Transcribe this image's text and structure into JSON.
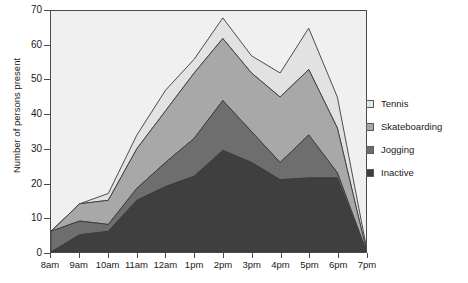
{
  "chart_data": {
    "type": "area",
    "stacked": true,
    "title": "",
    "subtitle": "",
    "xlabel": "",
    "ylabel": "Number of persons present",
    "categories": [
      "8am",
      "9am",
      "10am",
      "11am",
      "12am",
      "1pm",
      "2pm",
      "3pm",
      "4pm",
      "5pm",
      "6pm",
      "7pm"
    ],
    "x_tick_labels": [
      "8am",
      "9am",
      "10am",
      "11am",
      "12am",
      "1pm",
      "2pm",
      "3pm",
      "4pm",
      "5pm",
      "6pm",
      "7pm"
    ],
    "y_tick_labels": [
      "0",
      "10",
      "20",
      "30",
      "40",
      "50",
      "60",
      "70"
    ],
    "y_ticks": [
      0,
      10,
      20,
      30,
      40,
      50,
      60,
      70
    ],
    "ylim": [
      0,
      70
    ],
    "xlim_index": [
      0,
      11
    ],
    "grid": false,
    "legend_position": "right",
    "plot_background": "#f0f0f0",
    "axis_color": "#4a4a4a",
    "series": [
      {
        "name": "Inactive",
        "color": "#3f3f3f",
        "order": 1,
        "values": [
          0,
          5,
          6,
          15,
          19,
          22,
          29.5,
          26,
          21,
          21.5,
          21.5,
          0
        ]
      },
      {
        "name": "Jogging",
        "color": "#6e6e6e",
        "order": 2,
        "values": [
          6,
          4,
          2,
          3.5,
          7,
          11,
          14.5,
          9,
          5,
          12.5,
          1.5,
          0.5
        ]
      },
      {
        "name": "Skateboarding",
        "color": "#a8a8a8",
        "order": 3,
        "values": [
          0,
          5,
          7,
          11.5,
          15,
          19,
          18,
          17,
          19,
          19,
          13,
          0.5
        ]
      },
      {
        "name": "Tennis",
        "color": "#e2e2e2",
        "order": 4,
        "values": [
          0,
          0,
          2,
          4,
          6,
          4,
          6,
          5,
          7,
          12,
          9,
          1
        ]
      }
    ],
    "cumulative_totals": [
      6,
      14,
      17,
      34,
      47,
      56,
      68,
      57,
      52,
      65,
      45,
      2
    ]
  },
  "legend": {
    "items": [
      {
        "label": "Tennis",
        "swatch": "#e6e6e6"
      },
      {
        "label": "Skateboarding",
        "swatch": "#a8a8a8"
      },
      {
        "label": "Jogging",
        "swatch": "#6e6e6e"
      },
      {
        "label": "Inactive",
        "swatch": "#3f3f3f"
      }
    ]
  }
}
